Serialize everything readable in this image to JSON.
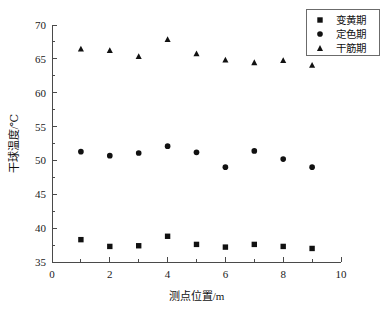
{
  "chart_data": {
    "type": "scatter",
    "title": "",
    "xlabel": "测点位置/m",
    "ylabel": "干球温度/℃",
    "xlim": [
      0,
      10
    ],
    "ylim": [
      35,
      70
    ],
    "xticks": [
      0,
      2,
      4,
      6,
      8,
      10
    ],
    "xtick_labels": [
      "0",
      "2",
      "4",
      "6",
      "8",
      "10"
    ],
    "x_minor_ticks": [
      1,
      3,
      5,
      7,
      9
    ],
    "yticks": [
      35,
      40,
      45,
      50,
      55,
      60,
      65,
      70
    ],
    "ytick_labels": [
      "35",
      "40",
      "45",
      "50",
      "55",
      "60",
      "65",
      "70"
    ],
    "y_minor_ticks": [
      37.5,
      42.5,
      47.5,
      52.5,
      57.5,
      62.5,
      67.5
    ],
    "grid": false,
    "legend_position": "top-right",
    "x": [
      1,
      2,
      3,
      4,
      5,
      6,
      7,
      8,
      9
    ],
    "series": [
      {
        "name": "变黄期",
        "marker": "square",
        "color": "#111111",
        "values": [
          38.3,
          37.3,
          37.4,
          38.8,
          37.6,
          37.2,
          37.6,
          37.3,
          37.0
        ]
      },
      {
        "name": "定色期",
        "marker": "circle",
        "color": "#111111",
        "values": [
          51.3,
          50.7,
          51.1,
          52.1,
          51.2,
          49.0,
          51.4,
          50.2,
          49.0
        ]
      },
      {
        "name": "干筋期",
        "marker": "triangle",
        "color": "#111111",
        "values": [
          66.5,
          66.3,
          65.4,
          67.9,
          65.8,
          64.9,
          64.5,
          64.8,
          64.1
        ]
      }
    ]
  },
  "legend": {
    "entries": [
      {
        "label": "变黄期",
        "marker": "square"
      },
      {
        "label": "定色期",
        "marker": "circle"
      },
      {
        "label": "干筋期",
        "marker": "triangle"
      }
    ]
  }
}
